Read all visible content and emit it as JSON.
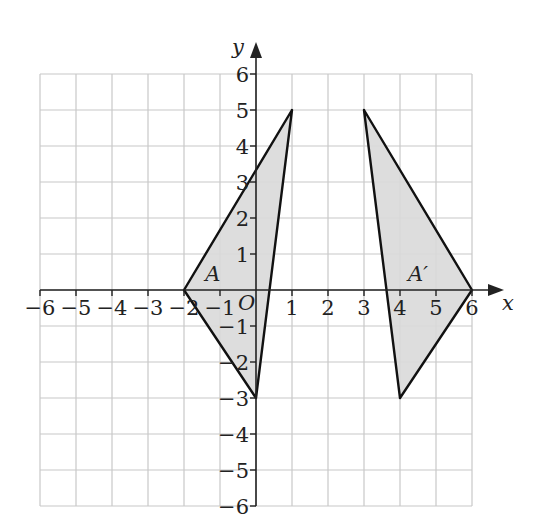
{
  "diagram": {
    "type": "coordinate-grid-transformation",
    "axes": {
      "x_label": "x",
      "y_label": "y",
      "x_range": [
        -6,
        6
      ],
      "y_range": [
        -6,
        6
      ],
      "origin_label": "O",
      "x_ticks": [
        "−6",
        "−5",
        "−4",
        "−3",
        "−2",
        "−1",
        "1",
        "2",
        "3",
        "4",
        "5",
        "6"
      ],
      "y_ticks": [
        "6",
        "5",
        "4",
        "3",
        "2",
        "1",
        "−1",
        "−2",
        "−3",
        "−4",
        "−5",
        "−6"
      ]
    },
    "shapes": [
      {
        "label": "A",
        "vertices": [
          [
            -2,
            0
          ],
          [
            1,
            5
          ],
          [
            0,
            -3
          ]
        ],
        "fill": "#d9d9d9",
        "stroke": "#111111"
      },
      {
        "label": "A′",
        "vertices": [
          [
            3,
            5
          ],
          [
            6,
            0
          ],
          [
            4,
            -3
          ]
        ],
        "fill": "#d9d9d9",
        "stroke": "#111111"
      }
    ],
    "colors": {
      "grid": "#c8c8c8",
      "axis": "#222222"
    }
  }
}
